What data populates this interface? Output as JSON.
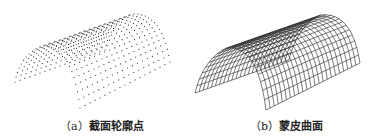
{
  "figures": [
    {
      "id": "a",
      "label": "（a）",
      "title": "截面轮廓点",
      "style": "dots",
      "sections": 19,
      "points_per_section": 26,
      "front_arch": {
        "left_foot": [
          15,
          82
        ],
        "left_ctrl": [
          20,
          55
        ],
        "peak": [
          42,
          46
        ],
        "right_ctrl": [
          72,
          44
        ],
        "right_foot": [
          80,
          108
        ]
      },
      "back_shift": [
        90,
        -32
      ],
      "color": "#333333"
    },
    {
      "id": "b",
      "label": "（b）",
      "title": "蒙皮曲面",
      "style": "mesh",
      "sections": 24,
      "points_per_section": 22,
      "front_arch": {
        "left_foot": [
          195,
          93
        ],
        "left_ctrl": [
          203,
          60
        ],
        "peak": [
          226,
          48
        ],
        "right_ctrl": [
          258,
          44
        ],
        "right_foot": [
          266,
          110
        ]
      },
      "back_shift": [
        94,
        -33
      ],
      "color": "#222222"
    }
  ]
}
